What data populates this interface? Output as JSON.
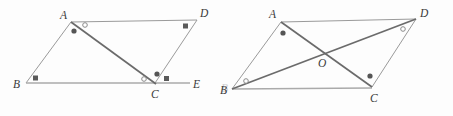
{
  "figure_set": {
    "title": "Two triangle/parallelogram congruence diagrams",
    "background_color": "#fdfdfd",
    "stroke_color": "#9a9a9a",
    "heavy_stroke_color": "#6b6b6b",
    "label_color": "#3a3a3a"
  },
  "left_figure": {
    "name": "figure-left",
    "description": "Quadrilateral ABCD with base extended to E and diagonal AC drawn",
    "vertices": [
      {
        "id": "A",
        "label": "A",
        "x": 71,
        "y": 22,
        "label_x": 60,
        "label_y": 19
      },
      {
        "id": "B",
        "label": "B",
        "x": 26,
        "y": 83,
        "label_x": 15,
        "label_y": 87
      },
      {
        "id": "C",
        "label": "C",
        "x": 155,
        "y": 83,
        "label_x": 152,
        "label_y": 98
      },
      {
        "id": "D",
        "label": "D",
        "x": 197,
        "y": 20,
        "label_x": 201,
        "label_y": 17
      },
      {
        "id": "E",
        "label": "E",
        "x": 190,
        "y": 83,
        "label_x": 192,
        "label_y": 87
      }
    ],
    "segments": [
      {
        "name": "segment-AB",
        "from": "A",
        "to": "B",
        "style": "thin"
      },
      {
        "name": "segment-AD",
        "from": "A",
        "to": "D",
        "style": "thin"
      },
      {
        "name": "segment-CD",
        "from": "C",
        "to": "D",
        "style": "thin"
      },
      {
        "name": "segment-AC-diagonal",
        "from": "A",
        "to": "C",
        "style": "heavy"
      },
      {
        "name": "segment-BE-base",
        "from": "B",
        "to": "E",
        "style": "base"
      }
    ],
    "angle_marks": [
      {
        "name": "angle-mark-A-dot",
        "type": "dot",
        "at": "A",
        "x": 74,
        "y": 31,
        "meaning": "angle BAC"
      },
      {
        "name": "angle-mark-A-circle",
        "type": "circle",
        "at": "A",
        "x": 85,
        "y": 25,
        "meaning": "angle CAD"
      },
      {
        "name": "angle-mark-B-square",
        "type": "square",
        "at": "B",
        "x": 36,
        "y": 78,
        "meaning": "angle ABC"
      },
      {
        "name": "angle-mark-C-circle",
        "type": "circle",
        "at": "C",
        "x": 145,
        "y": 79,
        "meaning": "angle ACB"
      },
      {
        "name": "angle-mark-C-dot",
        "type": "dot",
        "at": "C",
        "x": 156,
        "y": 74,
        "meaning": "angle ACD"
      },
      {
        "name": "angle-mark-C-square",
        "type": "square",
        "at": "C",
        "x": 167,
        "y": 78,
        "meaning": "angle DCE"
      },
      {
        "name": "angle-mark-D-square",
        "type": "square",
        "at": "D",
        "x": 186,
        "y": 26,
        "meaning": "angle ADC"
      }
    ]
  },
  "right_figure": {
    "name": "figure-right",
    "description": "Parallelogram ABCD with diagonals AC and BD meeting at O",
    "vertices": [
      {
        "id": "A",
        "label": "A",
        "x": 281,
        "y": 22,
        "label_x": 269,
        "label_y": 18
      },
      {
        "id": "B",
        "label": "B",
        "x": 232,
        "y": 89,
        "label_x": 222,
        "label_y": 93
      },
      {
        "id": "C",
        "label": "C",
        "x": 372,
        "y": 87,
        "label_x": 372,
        "label_y": 101
      },
      {
        "id": "D",
        "label": "D",
        "x": 416,
        "y": 19,
        "label_x": 420,
        "label_y": 17
      },
      {
        "id": "O",
        "label": "O",
        "x": 324,
        "y": 54,
        "label_x": 321,
        "label_y": 66
      }
    ],
    "segments": [
      {
        "name": "segment-AB",
        "from": "A",
        "to": "B",
        "style": "thin"
      },
      {
        "name": "segment-AD",
        "from": "A",
        "to": "D",
        "style": "thin"
      },
      {
        "name": "segment-DC",
        "from": "D",
        "to": "C",
        "style": "thin"
      },
      {
        "name": "segment-BC-base",
        "from": "B",
        "to": "C",
        "style": "base"
      },
      {
        "name": "segment-AC-diagonal",
        "from": "A",
        "to": "C",
        "style": "heavy"
      },
      {
        "name": "segment-BD-diagonal",
        "from": "B",
        "to": "D",
        "style": "heavy"
      }
    ],
    "intersection_label": "O",
    "angle_marks": [
      {
        "name": "angle-mark-A-dot",
        "type": "dot",
        "at": "A",
        "x": 283,
        "y": 33,
        "meaning": "angle BAC"
      },
      {
        "name": "angle-mark-B-circle",
        "type": "circle",
        "at": "B",
        "x": 245,
        "y": 82,
        "meaning": "angle ABD"
      },
      {
        "name": "angle-mark-C-dot",
        "type": "dot",
        "at": "C",
        "x": 369,
        "y": 76,
        "meaning": "angle ACD"
      },
      {
        "name": "angle-mark-D-circle",
        "type": "circle",
        "at": "D",
        "x": 404,
        "y": 28,
        "meaning": "angle BDC"
      }
    ]
  },
  "artifacts": {
    "faint_right_edge_label": "B"
  }
}
